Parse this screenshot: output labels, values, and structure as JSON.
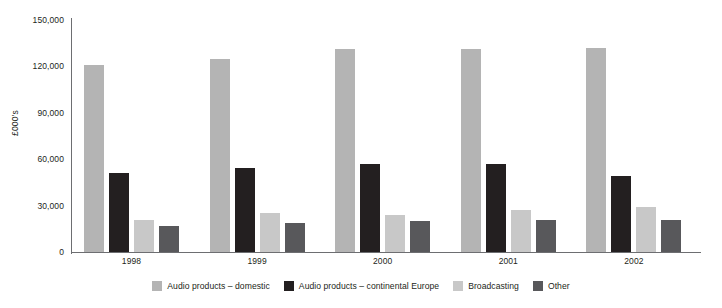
{
  "chart_data": {
    "type": "bar",
    "title": "",
    "subtitle": "",
    "xlabel": "",
    "ylabel": "£000's",
    "categories": [
      "1998",
      "1999",
      "2000",
      "2001",
      "2002"
    ],
    "series": [
      {
        "name": "Audio products – domestic",
        "color": "#b4b4b4",
        "values": [
          121000,
          125000,
          131000,
          131000,
          132000
        ]
      },
      {
        "name": "Audio products – continental Europe",
        "color": "#231f20",
        "values": [
          51000,
          54000,
          57000,
          57000,
          49000
        ]
      },
      {
        "name": "Broadcasting",
        "color": "#c8c8c8",
        "values": [
          21000,
          25000,
          24000,
          27000,
          29000
        ]
      },
      {
        "name": "Other",
        "color": "#58585b",
        "values": [
          17000,
          19000,
          20000,
          21000,
          21000
        ]
      }
    ],
    "ylim": [
      0,
      150000
    ],
    "yticks": [
      0,
      30000,
      60000,
      90000,
      120000,
      150000
    ],
    "ytick_labels": [
      "0",
      "30,000",
      "60,000",
      "90,000",
      "120,000",
      "150,000"
    ],
    "grid": false,
    "legend_position": "bottom",
    "axis_color": "#6d6e71",
    "background": "#ffffff"
  },
  "legend": {
    "items": [
      {
        "label": "Audio products – domestic",
        "color": "#b4b4b4"
      },
      {
        "label": "Audio products – continental Europe",
        "color": "#231f20"
      },
      {
        "label": "Broadcasting",
        "color": "#c8c8c8"
      },
      {
        "label": "Other",
        "color": "#58585b"
      }
    ]
  }
}
